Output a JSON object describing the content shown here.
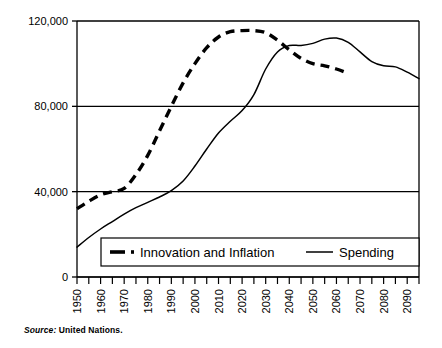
{
  "source_note": {
    "label": "Source:",
    "text": "United Nations."
  },
  "chart_data": {
    "type": "line",
    "title": "",
    "subtitle": "",
    "xlabel": "",
    "ylabel": "",
    "grid": true,
    "legend_position": "bottom-inside",
    "xlim": [
      1950,
      2095
    ],
    "ylim": [
      0,
      120000
    ],
    "y_ticks": [
      0,
      40000,
      80000,
      120000
    ],
    "y_tick_labels": [
      "0",
      "40,000",
      "80,000",
      "120,000"
    ],
    "x_ticks": [
      1950,
      1960,
      1970,
      1980,
      1990,
      2000,
      2010,
      2020,
      2030,
      2040,
      2050,
      2060,
      2070,
      2080,
      2090
    ],
    "x_tick_labels": [
      "1950",
      "1960",
      "1970",
      "1980",
      "1990",
      "2000",
      "2010",
      "2020",
      "2030",
      "2040",
      "2050",
      "2060",
      "2070",
      "2080",
      "2090"
    ],
    "x_minor_tick_step": 5,
    "series": [
      {
        "name": "Innovation and Inflation",
        "style": "dashed",
        "color": "#000000",
        "x": [
          1950,
          1955,
          1960,
          1965,
          1970,
          1975,
          1980,
          1985,
          1990,
          1995,
          2000,
          2005,
          2010,
          2015,
          2020,
          2025,
          2030,
          2035,
          2040,
          2045,
          2050,
          2055,
          2060,
          2065
        ],
        "values": [
          32000,
          35500,
          38500,
          40000,
          41500,
          48000,
          57000,
          68500,
          80000,
          91000,
          100000,
          107500,
          112500,
          115000,
          115500,
          115500,
          114500,
          111000,
          106500,
          102500,
          100000,
          99000,
          97500,
          95500
        ]
      },
      {
        "name": "Spending",
        "style": "solid",
        "color": "#000000",
        "x": [
          1950,
          1955,
          1960,
          1965,
          1970,
          1975,
          1980,
          1985,
          1990,
          1995,
          2000,
          2005,
          2010,
          2015,
          2020,
          2025,
          2030,
          2035,
          2040,
          2045,
          2050,
          2055,
          2060,
          2065,
          2070,
          2075,
          2080,
          2085,
          2090,
          2095
        ],
        "values": [
          14000,
          18500,
          22500,
          26000,
          29500,
          32500,
          35000,
          37500,
          40500,
          45000,
          52000,
          60000,
          67500,
          73000,
          78000,
          85500,
          97500,
          105500,
          108500,
          108500,
          109500,
          111500,
          112000,
          110000,
          105500,
          101000,
          99000,
          98500,
          96000,
          93000
        ]
      }
    ]
  },
  "legend": {
    "items": [
      {
        "label": "Innovation and Inflation",
        "style": "dashed"
      },
      {
        "label": "Spending",
        "style": "solid"
      }
    ]
  }
}
